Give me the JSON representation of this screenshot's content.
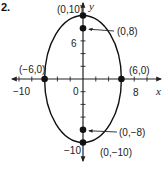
{
  "problem_number": "2.",
  "chart_data": {
    "type": "scatter",
    "title": "",
    "xlabel": "x",
    "ylabel": "y",
    "xlim": [
      -11,
      11
    ],
    "ylim": [
      -11.5,
      11
    ],
    "grid": false,
    "x_ticks": [
      -10,
      -8,
      -6,
      -4,
      -2,
      2,
      4,
      6,
      8,
      10
    ],
    "y_ticks": [
      -10,
      -8,
      -6,
      -4,
      -2,
      2,
      4,
      6,
      8,
      10
    ],
    "tick_labels": [
      {
        "axis": "x",
        "value": -10,
        "text": "−10"
      },
      {
        "axis": "x",
        "value": 8,
        "text": "8"
      },
      {
        "axis": "y",
        "value": 6,
        "text": "6"
      },
      {
        "axis": "y",
        "value": -10,
        "text": "−10"
      },
      {
        "axis": "origin",
        "value": 0,
        "text": "0"
      }
    ],
    "ellipse": {
      "center": [
        0,
        0
      ],
      "semi_x": 6,
      "semi_y": 10
    },
    "points": [
      {
        "x": 0,
        "y": 10,
        "label": "(0,10)",
        "type": "vertex"
      },
      {
        "x": 0,
        "y": -10,
        "label": "(0,−10)",
        "type": "vertex"
      },
      {
        "x": -6,
        "y": 0,
        "label": "(−6,0)",
        "type": "co-vertex"
      },
      {
        "x": 6,
        "y": 0,
        "label": "(6,0)",
        "type": "co-vertex"
      },
      {
        "x": 0,
        "y": 8,
        "label": "(0,8)",
        "type": "focus"
      },
      {
        "x": 0,
        "y": -8,
        "label": "(0,−8)",
        "type": "focus"
      }
    ]
  }
}
